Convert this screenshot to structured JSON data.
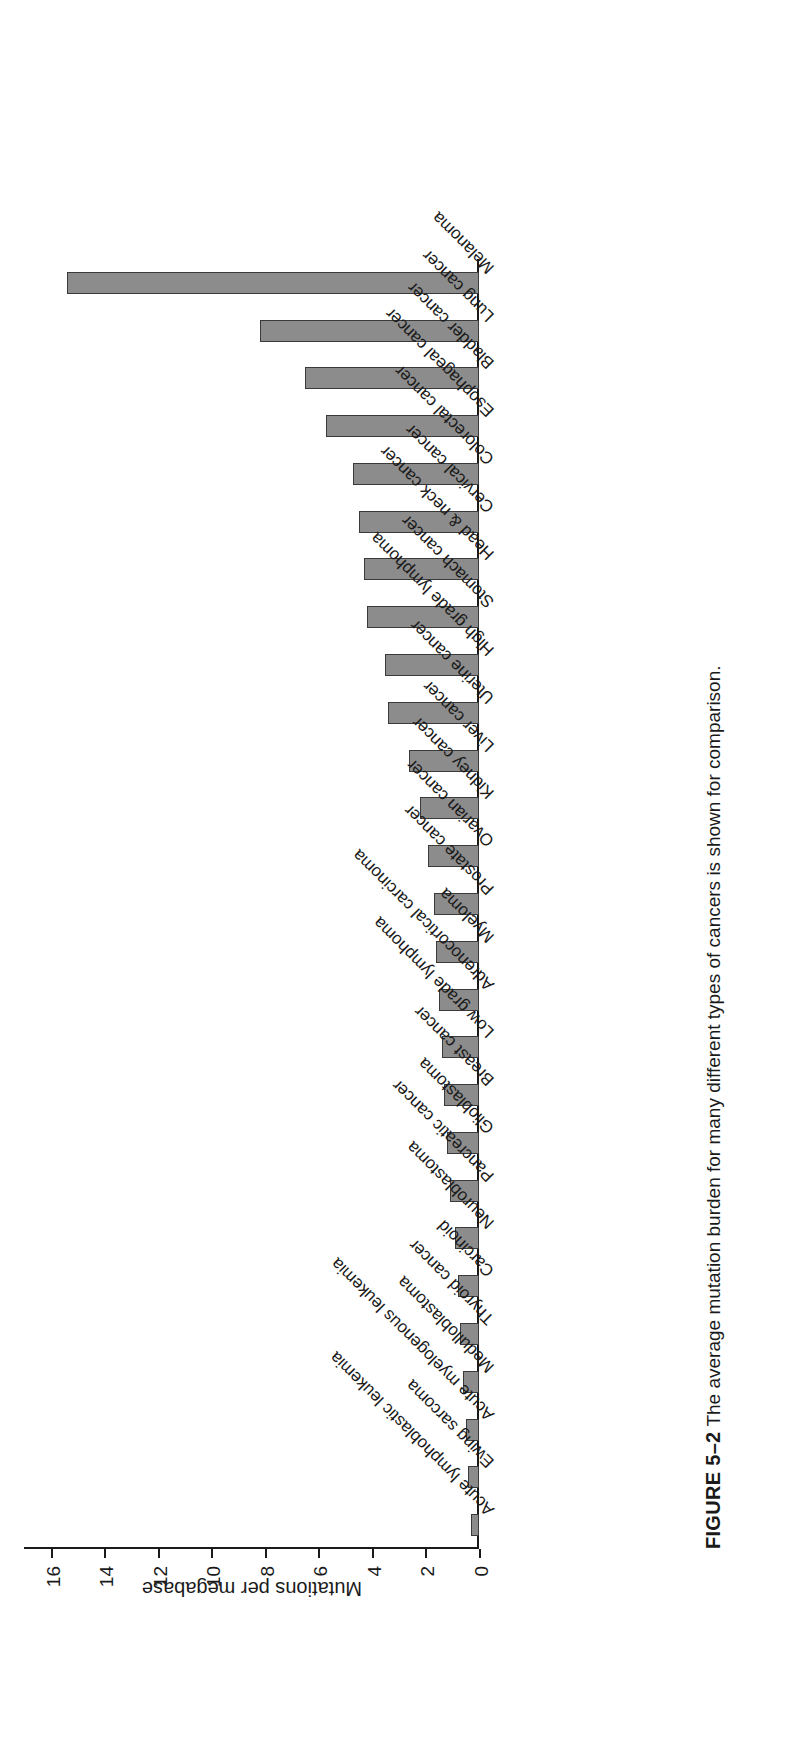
{
  "figure": {
    "number": "FIGURE 5–2",
    "caption": "The average mutation burden for many different types of cancers is shown for comparison."
  },
  "chart_data": {
    "type": "bar",
    "title": "",
    "xlabel": "",
    "ylabel": "Mutations per megabase",
    "ylim": [
      0,
      17
    ],
    "yticks": [
      "0",
      "2",
      "4",
      "6",
      "8",
      "10",
      "12",
      "14",
      "16"
    ],
    "grid": false,
    "legend": "none",
    "orientation": "vertical",
    "categories": [
      "Acute lymphoblastic leukemia",
      "Ewing sarcoma",
      "Acute myelogenous leukemia",
      "Medulloblastoma",
      "Thyroid cancer",
      "Carcinoid",
      "Neuroblastoma",
      "Pancreatic cancer",
      "Glioblastoma",
      "Breast cancer",
      "Low grade lymphoma",
      "Adrenocortical carcinoma",
      "Myeloma",
      "Prostate cancer",
      "Ovarian cancer",
      "Kidney cancer",
      "Liver cancer",
      "Uterine cancer",
      "High grade lymphoma",
      "Stomach cancer",
      "Head & neck cancer",
      "Cervical cancer",
      "Colorectal cancer",
      "Esophageal cancer",
      "Bladder cancer",
      "Lung cancer",
      "Melanoma"
    ],
    "values": [
      0.3,
      0.4,
      0.5,
      0.6,
      0.7,
      0.8,
      0.9,
      1.1,
      1.2,
      1.3,
      1.4,
      1.5,
      1.6,
      1.7,
      1.9,
      2.2,
      2.6,
      3.4,
      3.5,
      4.2,
      4.3,
      4.5,
      4.7,
      5.7,
      6.5,
      8.2,
      15.4
    ]
  },
  "style": {
    "bar_fill": "#8c8c8c",
    "bar_stroke": "#3a3a3a",
    "axis_color": "#1a1a1a"
  }
}
